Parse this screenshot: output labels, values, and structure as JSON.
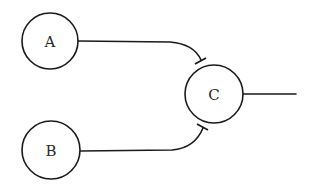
{
  "diagram": {
    "type": "inhibition-network",
    "nodes": [
      {
        "id": "A",
        "label": "A"
      },
      {
        "id": "B",
        "label": "B"
      },
      {
        "id": "C",
        "label": "C"
      }
    ],
    "edges": [
      {
        "from": "A",
        "to": "C",
        "type": "inhibition"
      },
      {
        "from": "B",
        "to": "C",
        "type": "inhibition"
      },
      {
        "from": "C",
        "to": "output",
        "type": "line"
      }
    ],
    "colors": {
      "stroke": "#1a1a1a",
      "background": "#ffffff",
      "text": "#2a2a2a"
    }
  }
}
